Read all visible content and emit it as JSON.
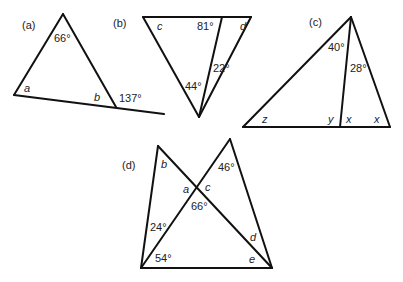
{
  "figures": [
    {
      "id": "a",
      "label": "(a)",
      "angles": {
        "apex": "66°",
        "left": "a",
        "right": "b",
        "exterior": "137°"
      }
    },
    {
      "id": "b",
      "label": "(b)",
      "angles": {
        "top_left": "c",
        "top_middle": "81°",
        "top_right": "d",
        "bottom_left_part": "44°",
        "bottom_right_part": "22°"
      }
    },
    {
      "id": "c",
      "label": "(c)",
      "angles": {
        "apex_left": "40°",
        "apex_right": "28°",
        "bottom_left": "z",
        "foot_left": "y",
        "foot_right": "x",
        "bottom_right": "x"
      }
    },
    {
      "id": "d",
      "label": "(d)",
      "angles": {
        "top_left": "b",
        "top_right": "46°",
        "cross_left": "a",
        "cross_right": "c",
        "cross_bottom": "66°",
        "left_upper": "24°",
        "left_lower": "54°",
        "right_upper": "d",
        "right_lower": "e"
      }
    }
  ]
}
